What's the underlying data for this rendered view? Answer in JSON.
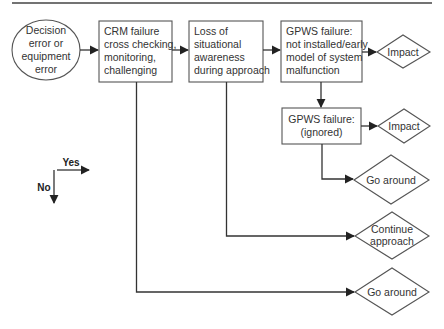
{
  "diagram": {
    "start": {
      "lines": [
        "Decision",
        "error or",
        "equipment",
        "error"
      ]
    },
    "boxes": [
      {
        "id": "crm",
        "lines": [
          "CRM failure",
          "cross checking,",
          "monitoring,",
          "challenging"
        ]
      },
      {
        "id": "loss",
        "lines": [
          "Loss of",
          "situational",
          "awareness",
          "during approach"
        ]
      },
      {
        "id": "gpws1",
        "lines": [
          "GPWS failure:",
          "not installed/early",
          "model of system",
          "malfunction"
        ]
      },
      {
        "id": "gpws2",
        "lines": [
          "GPWS failure:",
          "(ignored)"
        ]
      }
    ],
    "outcomes": [
      {
        "id": "impact1",
        "lines": [
          "Impact"
        ]
      },
      {
        "id": "impact2",
        "lines": [
          "Impact"
        ]
      },
      {
        "id": "goaround1",
        "lines": [
          "Go around"
        ]
      },
      {
        "id": "continue",
        "lines": [
          "Continue",
          "approach"
        ]
      },
      {
        "id": "goaround2",
        "lines": [
          "Go around"
        ]
      }
    ],
    "legend": {
      "yes": "Yes",
      "no": "No"
    }
  }
}
